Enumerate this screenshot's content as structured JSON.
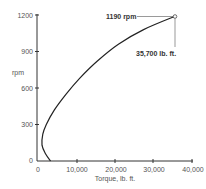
{
  "chart_data": {
    "type": "line",
    "title": "",
    "xlabel": "Torque, lb. ft.",
    "ylabel": "rpm",
    "xlim": [
      0,
      40000
    ],
    "ylim": [
      0,
      1200
    ],
    "x_ticks": [
      "0",
      "10,000",
      "20,000",
      "30,000",
      "40,000"
    ],
    "y_ticks": [
      "0",
      "300",
      "600",
      "900",
      "1200"
    ],
    "grid": false,
    "series": [
      {
        "name": "torque-rpm curve",
        "points": [
          {
            "x": 3500,
            "y": 0
          },
          {
            "x": 2200,
            "y": 60
          },
          {
            "x": 1300,
            "y": 130
          },
          {
            "x": 1500,
            "y": 220
          },
          {
            "x": 2400,
            "y": 300
          },
          {
            "x": 4500,
            "y": 420
          },
          {
            "x": 7500,
            "y": 550
          },
          {
            "x": 11000,
            "y": 680
          },
          {
            "x": 15500,
            "y": 820
          },
          {
            "x": 21000,
            "y": 960
          },
          {
            "x": 27500,
            "y": 1080
          },
          {
            "x": 35700,
            "y": 1190
          }
        ]
      }
    ],
    "annotations": [
      {
        "text": "1190 rpm",
        "x": 35700,
        "y": 1190
      },
      {
        "text": "35,700 lb. ft.",
        "x": 35700,
        "y": 1190
      }
    ]
  },
  "labels": {
    "ylabel": "rpm",
    "xlabel": "Torque, lb. ft.",
    "x_ticks": [
      "0",
      "10,000",
      "20,000",
      "30,000",
      "40,000"
    ],
    "y_ticks": [
      "0",
      "300",
      "600",
      "900",
      "1200"
    ],
    "annotation_rpm": "1190 rpm",
    "annotation_torque": "35,700 lb. ft."
  }
}
